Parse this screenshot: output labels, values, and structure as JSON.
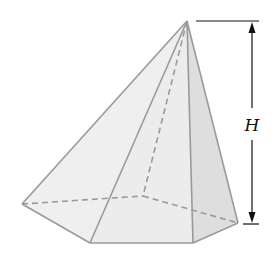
{
  "diagram": {
    "height_label": "H",
    "colors": {
      "edge": "#9a9a9a",
      "face_light": "#efefef",
      "face_mid": "#e6e6e6",
      "face_dark": "#dcdcdc",
      "dimension_line": "#111111"
    },
    "apex": [
      187,
      21
    ],
    "base_vertices": {
      "left": [
        22,
        204
      ],
      "front_left": [
        90,
        243
      ],
      "front_right": [
        193,
        243
      ],
      "right": [
        238,
        223
      ],
      "back": [
        143,
        196
      ]
    }
  }
}
